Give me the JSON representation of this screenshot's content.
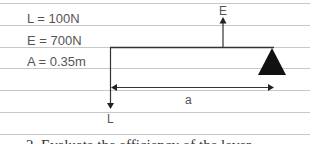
{
  "givens": [
    {
      "text": "L = 100N"
    },
    {
      "text": "E = 700N"
    },
    {
      "text": "A = 0.35m"
    }
  ],
  "diagram": {
    "effort_label": "E",
    "load_label": "L",
    "distance_label": "a",
    "colors": {
      "line": "#333333",
      "fulcrum": "#111111",
      "rule": "#c8c8c8"
    }
  },
  "question": {
    "text": "2. Evaluate the efficiency of the lever"
  }
}
